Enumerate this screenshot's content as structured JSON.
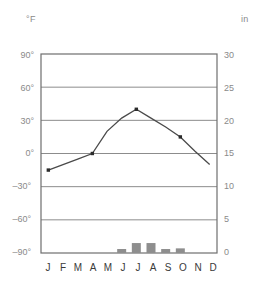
{
  "axes": {
    "left_unit": "°F",
    "right_unit": "in",
    "left_ticks": [
      "90°",
      "60°",
      "30°",
      "0°",
      "–30°",
      "–60°",
      "–90°"
    ],
    "right_ticks": [
      "30",
      "25",
      "20",
      "15",
      "10",
      "5",
      "0"
    ]
  },
  "months": [
    "J",
    "F",
    "M",
    "A",
    "M",
    "J",
    "J",
    "A",
    "S",
    "O",
    "N",
    "D"
  ],
  "colors": {
    "frame": "#6e6e6e",
    "gridline": "#8c8c8c",
    "temperature_line": "#4a4a4a",
    "temperature_marker": "#2b2b2b",
    "precipitation_bar": "#8e8e8e",
    "tick_text": "#8a8a8a",
    "month_text": "#3a3a3a"
  },
  "chart_data": {
    "type": "line",
    "title": "",
    "xlabel": "",
    "ylabel": "°F",
    "categories": [
      "J",
      "F",
      "M",
      "A",
      "M",
      "J",
      "J",
      "A",
      "S",
      "A",
      "N",
      "D"
    ],
    "grid": true,
    "legend": "none",
    "series": [
      {
        "name": "Temperature",
        "type": "line",
        "unit": "°F",
        "axis": "left",
        "ylim": [
          -90,
          90
        ],
        "ytick_step": 30,
        "values": [
          -15,
          -10,
          -5,
          0,
          20,
          32,
          40,
          32,
          24,
          15,
          2,
          -10
        ],
        "marked_points": [
          "J",
          "A",
          "J",
          "O"
        ]
      },
      {
        "name": "Precipitation",
        "type": "bar",
        "unit": "in",
        "axis": "right",
        "ylim": [
          0,
          30
        ],
        "ytick_step": 5,
        "values": [
          0,
          0,
          0,
          0,
          0,
          0.6,
          1.5,
          1.5,
          0.6,
          0.7,
          0,
          0
        ]
      }
    ]
  }
}
